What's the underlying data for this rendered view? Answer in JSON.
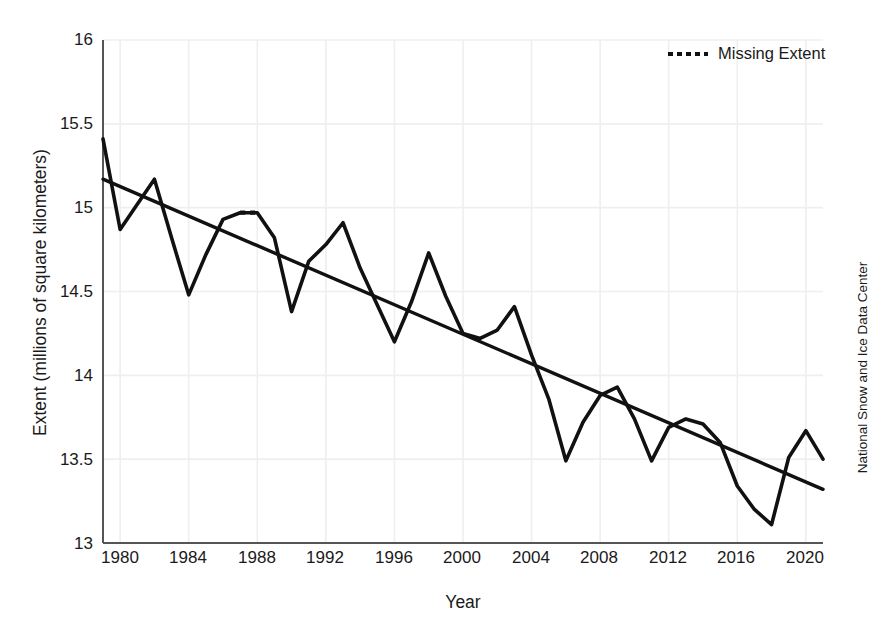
{
  "title": "Arctic sea ice extent",
  "axes": {
    "xlabel": "Year",
    "ylabel": "Extent (millions of square kilometers)",
    "yticks": [
      "13",
      "13.5",
      "14",
      "14.5",
      "15",
      "15.5",
      "16"
    ],
    "xticks": [
      "1980",
      "1984",
      "1988",
      "1992",
      "1996",
      "2000",
      "2004",
      "2008",
      "2012",
      "2016",
      "2020"
    ]
  },
  "legend": {
    "items": [
      {
        "label": "Missing Extent",
        "style": "dotted",
        "color": "#111111"
      }
    ]
  },
  "credit": "National Snow and Ice Data Center",
  "colors": {
    "line": "#111111",
    "trend": "#111111",
    "grid": "#efefef",
    "axis": "#555555",
    "background": "#ffffff"
  },
  "chart_data": {
    "type": "line",
    "title": "Arctic sea ice extent",
    "xlabel": "Year",
    "ylabel": "Extent (millions of square kilometers)",
    "xlim": [
      1979,
      2021
    ],
    "ylim": [
      13,
      16
    ],
    "yticks": [
      13,
      13.5,
      14,
      14.5,
      15,
      15.5,
      16
    ],
    "xticks": [
      1980,
      1984,
      1988,
      1992,
      1996,
      2000,
      2004,
      2008,
      2012,
      2016,
      2020
    ],
    "grid": true,
    "legend_position": "top-right",
    "series": [
      {
        "name": "Extent",
        "style": "solid",
        "x": [
          1979,
          1980,
          1981,
          1982,
          1983,
          1984,
          1985,
          1986,
          1987,
          1988,
          1989,
          1990,
          1991,
          1992,
          1993,
          1994,
          1995,
          1996,
          1997,
          1998,
          1999,
          2000,
          2001,
          2002,
          2003,
          2004,
          2005,
          2006,
          2007,
          2008,
          2009,
          2010,
          2011,
          2012,
          2013,
          2014,
          2015,
          2016,
          2017,
          2018,
          2019,
          2020,
          2021
        ],
        "values": [
          15.41,
          14.87,
          15.02,
          15.17,
          14.82,
          14.48,
          14.72,
          14.93,
          14.97,
          14.97,
          14.82,
          14.38,
          14.68,
          14.78,
          14.91,
          14.64,
          14.42,
          14.2,
          14.44,
          14.73,
          14.47,
          14.25,
          14.22,
          14.27,
          14.41,
          14.12,
          13.86,
          13.49,
          13.72,
          13.88,
          13.93,
          13.74,
          13.49,
          13.69,
          13.74,
          13.71,
          13.6,
          13.34,
          13.2,
          13.11,
          13.51,
          13.67,
          13.5
        ]
      },
      {
        "name": "Missing Extent",
        "style": "dotted",
        "x": [
          1987,
          1988
        ],
        "values": [
          14.97,
          14.97
        ]
      },
      {
        "name": "Trend",
        "style": "solid",
        "x": [
          1979,
          2021
        ],
        "values": [
          15.17,
          13.32
        ]
      }
    ]
  }
}
